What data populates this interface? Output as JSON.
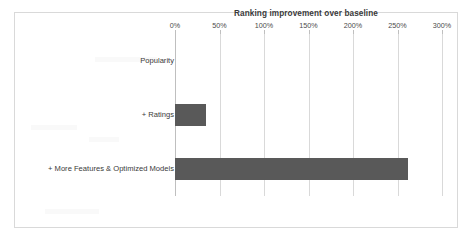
{
  "chart_data": {
    "type": "bar",
    "orientation": "horizontal",
    "title": "Ranking improvement over baseline",
    "xlabel": "",
    "ylabel": "",
    "categories": [
      "Popularity",
      "+ Ratings",
      "+ More Features & Optimized Models"
    ],
    "values": [
      0,
      35,
      262
    ],
    "value_suffix": "%",
    "xlim": [
      0,
      300
    ],
    "xticks": [
      0,
      50,
      100,
      150,
      200,
      250,
      300
    ],
    "xtick_labels": [
      "0%",
      "50%",
      "100%",
      "150%",
      "200%",
      "250%",
      "300%"
    ],
    "x_axis_position": "top",
    "grid": true,
    "grid_axis": "x",
    "legend": false,
    "series": [
      {
        "name": "Ranking improvement over baseline",
        "values": [
          0,
          35,
          262
        ],
        "color": "#595959"
      }
    ]
  },
  "colors": {
    "bar": "#595959",
    "gridline": "#d9d9d9",
    "axis": "#bfbfbf",
    "frame": "#d9d9d9",
    "background": "#ffffff",
    "title_text": "#3a3a3a",
    "tick_text": "#4a4a4a"
  }
}
